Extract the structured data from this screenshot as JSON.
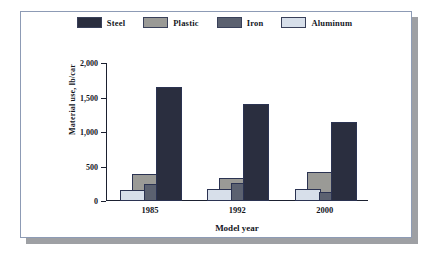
{
  "chart_data": {
    "type": "bar",
    "title": "",
    "xlabel": "Model year",
    "ylabel": "Material use, lb/car",
    "categories": [
      "1985",
      "1992",
      "2000"
    ],
    "ylim": [
      0,
      2000
    ],
    "yticks": [
      0,
      500,
      1000,
      1500,
      2000
    ],
    "ytick_labels": [
      "0",
      "500",
      "1,000",
      "1,500",
      "2,000"
    ],
    "grid": false,
    "legend_position": "top-center",
    "series": [
      {
        "name": "Steel",
        "color": "#2a2e3f",
        "values": [
          1650,
          1400,
          1150
        ]
      },
      {
        "name": "Plastic",
        "color": "#9a9a96",
        "values": [
          390,
          335,
          420
        ]
      },
      {
        "name": "Iron",
        "color": "#5b6170",
        "values": [
          245,
          260,
          135
        ]
      },
      {
        "name": "Aluminum",
        "color": "#d7dfea",
        "values": [
          155,
          175,
          175
        ]
      }
    ]
  },
  "legend": {
    "items": [
      {
        "label": "Steel"
      },
      {
        "label": "Plastic"
      },
      {
        "label": "Iron"
      },
      {
        "label": "Aluminum"
      }
    ]
  },
  "axes": {
    "y_label": "Material use, lb/car",
    "x_label": "Model year",
    "y_ticks": [
      "2,000",
      "1,500",
      "1,000",
      "500",
      "0"
    ],
    "x_ticks": [
      "1985",
      "1992",
      "2000"
    ]
  },
  "colors": {
    "steel": "#2a2e3f",
    "plastic": "#9a9a96",
    "iron": "#5b6170",
    "aluminum": "#d7dfea",
    "outline": "#2b3352",
    "frame": "#8d9bb5",
    "shadow": "#9ea0a4",
    "text": "#13161d"
  }
}
